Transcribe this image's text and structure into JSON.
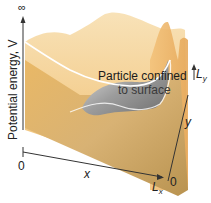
{
  "figure": {
    "type": "particle-in-a-two-dimensional-box",
    "axes": {
      "vertical_label": "Potential energy, V",
      "vertical_top_symbol": "∞",
      "x_label": "x",
      "y_label": "y",
      "x_origin": "0",
      "y_origin": "0",
      "x_end": "L",
      "x_end_sub": "x",
      "y_end": "L",
      "y_end_sub": "y"
    },
    "annotation": {
      "line1": "Particle confined",
      "line2": "to surface"
    },
    "colors": {
      "wall": "#f2c27a",
      "wall_light": "#f7dcaa",
      "floor": "#d6b06a",
      "floor_dark": "#b99350",
      "surface_grey": "#9a9a9a",
      "axis": "#333333",
      "edge_line": "#ffffff"
    }
  }
}
